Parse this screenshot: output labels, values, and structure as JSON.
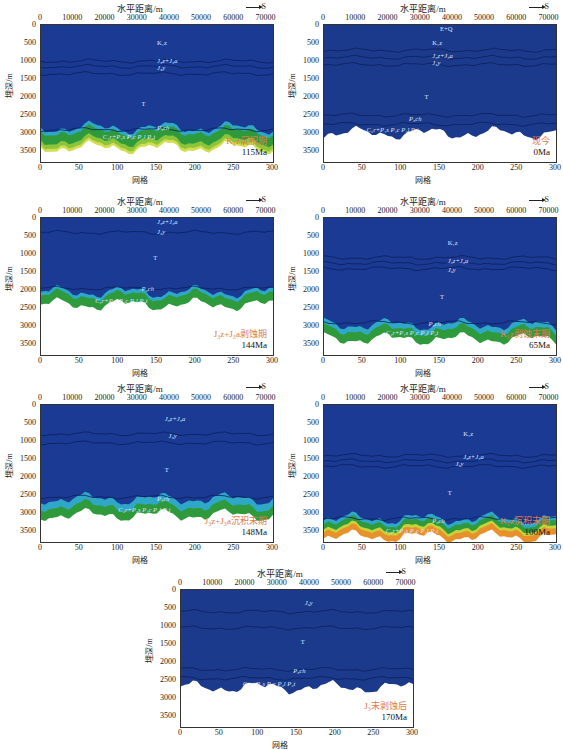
{
  "common": {
    "top_axis_title": "水平距离/m",
    "top_axis_ticks": [
      "0",
      "10000",
      "20000",
      "30000",
      "40000",
      "50000",
      "60000",
      "70000"
    ],
    "bottom_axis_title": "网格",
    "bottom_axis_ticks": [
      "0",
      "50",
      "100",
      "150",
      "200",
      "250",
      "300"
    ],
    "y_axis_title": "埋深/m",
    "y_axis_ticks": [
      "0",
      "500",
      "1000",
      "1500",
      "2000",
      "2500",
      "3000",
      "3500"
    ],
    "direction_label": "S",
    "colors": {
      "deep_blue": "#1a3a94",
      "cyan": "#2fa8c8",
      "green": "#2f9a3c",
      "yellow": "#c8d23a",
      "orange": "#e07a28",
      "label_red": "#e07a4a"
    }
  },
  "panels": [
    {
      "id": "p1",
      "stage_cn": "K₁z沉积期",
      "age": "115Ma",
      "formations": [
        "K₁z",
        "J₃z+J₃a",
        "J₃y",
        "T",
        "P₃ch",
        "C₂r+P₁s P₁c P₂l P₂t"
      ]
    },
    {
      "id": "p2",
      "stage_cn": "现今",
      "age": "0Ma",
      "formations": [
        "E+Q",
        "K₁z",
        "J₃z+J₃a",
        "J₃y",
        "T",
        "P₃ch",
        "C₂r+P₁s P₁c P₂l P₂t"
      ]
    },
    {
      "id": "p3",
      "stage_cn": "J₃z+J₃a剥蚀期",
      "age": "144Ma",
      "formations": [
        "J₃z+J₃a",
        "J₃y",
        "T",
        "P₃ch",
        "C₂r+P₁s P₁c P₂l P₂t"
      ]
    },
    {
      "id": "p4",
      "stage_cn": "K₁z剥蚀末期",
      "age": "65Ma",
      "formations": [
        "K₁z",
        "J₃z+J₃a",
        "J₃y",
        "T",
        "P₃ch",
        "C₂r+P₁s P₁c P₂l P₂t"
      ]
    },
    {
      "id": "p5",
      "stage_cn": "J₃z+J₃a沉积末期",
      "age": "148Ma",
      "formations": [
        "J₃z+J₃a",
        "J₃y",
        "T",
        "P₃ch",
        "C₂r+P₁s P₁c P₂l P₂t"
      ]
    },
    {
      "id": "p6",
      "stage_cn": "K₁z沉积末期",
      "age": "100Ma",
      "formations": [
        "K₁z",
        "J₃z+J₃a",
        "J₃y",
        "T",
        "P₃ch",
        "C₂r+P₁s P₁c P₂l P₂t"
      ]
    },
    {
      "id": "p7",
      "stage_cn": "J₃末剥蚀后",
      "age": "170Ma",
      "formations": [
        "J₃y",
        "T",
        "P₃ch",
        "C₂r+P₁s P₁c P₂l P₂t"
      ]
    }
  ],
  "chart_data": [
    {
      "type": "heatmap",
      "title": "K₁z沉积期 115Ma",
      "xlabel": "网格",
      "x2label": "水平距离/m",
      "ylabel": "埋深/m",
      "xlim": [
        0,
        300
      ],
      "ylim": [
        3800,
        0
      ],
      "basement_depth_m": 3400,
      "horizons_m": {
        "J3z+J3a_top": 1000,
        "J3y_top": 1300,
        "P3ch": 2900
      }
    },
    {
      "type": "heatmap",
      "title": "现今 0Ma",
      "xlabel": "网格",
      "x2label": "水平距离/m",
      "ylabel": "埋深/m",
      "xlim": [
        0,
        300
      ],
      "ylim": [
        3800,
        0
      ],
      "basement_depth_m": 3000,
      "horizons_m": {
        "K1z_top": 700,
        "J3z+J3a_top": 900,
        "J3y_top": 1100,
        "P3ch": 2500
      }
    },
    {
      "type": "heatmap",
      "title": "J₃z+J₃a剥蚀期 144Ma",
      "xlabel": "网格",
      "x2label": "水平距离/m",
      "ylabel": "埋深/m",
      "xlim": [
        0,
        300
      ],
      "ylim": [
        3800,
        0
      ],
      "basement_depth_m": 2400,
      "horizons_m": {
        "J3y_top": 400,
        "P3ch": 2000
      }
    },
    {
      "type": "heatmap",
      "title": "K₁z剥蚀末期 65Ma",
      "xlabel": "网格",
      "x2label": "水平距离/m",
      "ylabel": "埋深/m",
      "xlim": [
        0,
        300
      ],
      "ylim": [
        3800,
        0
      ],
      "basement_depth_m": 3350,
      "horizons_m": {
        "J3z+J3a_top": 1100,
        "J3y_top": 1400,
        "P3ch": 2900
      }
    },
    {
      "type": "heatmap",
      "title": "J₃z+J₃a沉积末期 148Ma",
      "xlabel": "网格",
      "x2label": "水平距离/m",
      "ylabel": "埋深/m",
      "xlim": [
        0,
        300
      ],
      "ylim": [
        3800,
        0
      ],
      "basement_depth_m": 3050,
      "horizons_m": {
        "J3y_top": 800,
        "P3ch": 2550
      }
    },
    {
      "type": "heatmap",
      "title": "K₁z沉积末期 100Ma",
      "xlabel": "网格",
      "x2label": "水平距离/m",
      "ylabel": "埋深/m",
      "xlim": [
        0,
        300
      ],
      "ylim": [
        3800,
        0
      ],
      "basement_depth_m": 3650,
      "horizons_m": {
        "J3z+J3a_top": 1400,
        "J3y_top": 1700,
        "P3ch": 3150
      }
    },
    {
      "type": "heatmap",
      "title": "J₃末剥蚀后 170Ma",
      "xlabel": "网格",
      "x2label": "水平距离/m",
      "ylabel": "埋深/m",
      "xlim": [
        0,
        300
      ],
      "ylim": [
        3800,
        0
      ],
      "basement_depth_m": 2700,
      "horizons_m": {
        "J3y_top": 600,
        "P3ch": 2200
      }
    }
  ]
}
